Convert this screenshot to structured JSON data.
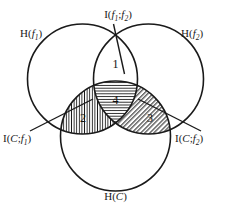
{
  "figure": {
    "background_color": "#ffffff",
    "stroke_color": "#1a1a1a"
  },
  "circles": {
    "left": {
      "label_main": "H",
      "label_open": "(",
      "label_var": "f",
      "label_sub": "1",
      "label_close": ")",
      "label_full": "H(f1)"
    },
    "right": {
      "label_main": "H",
      "label_open": "(",
      "label_var": "f",
      "label_sub": "2",
      "label_close": ")",
      "label_full": "H(f2)"
    },
    "bottom": {
      "label_main": "H",
      "label_open": "(",
      "label_var": "C",
      "label_close": ")",
      "label_full": "H(C)"
    }
  },
  "leader_labels": {
    "top": {
      "label_main": "I",
      "label_open": "(",
      "label_var1": "f",
      "label_sub1": "1",
      "label_sep": ";",
      "label_var2": "f",
      "label_sub2": "2",
      "label_close": ")",
      "label_full": "I(f1;f2)"
    },
    "bottom_left": {
      "label_main": "I",
      "label_open": "(",
      "label_var1": "C",
      "label_sep": ";",
      "label_var2": "f",
      "label_sub2": "1",
      "label_close": ")",
      "label_full": "I(C;f1)"
    },
    "bottom_right": {
      "label_main": "I",
      "label_open": "(",
      "label_var1": "C",
      "label_sep": ";",
      "label_var2": "f",
      "label_sub2": "2",
      "label_close": ")",
      "label_full": "I(C;f2)"
    }
  },
  "regions": [
    {
      "id": "region-1",
      "number": "1",
      "hatch": "none",
      "description": "f1 and f2 overlap excluding C"
    },
    {
      "id": "region-2",
      "number": "2",
      "hatch": "vertical",
      "description": "C and f1 overlap excluding f2"
    },
    {
      "id": "region-3",
      "number": "3",
      "hatch": "diagonal",
      "description": "C and f2 overlap excluding f1"
    },
    {
      "id": "region-4",
      "number": "4",
      "hatch": "horizontal",
      "description": "triple intersection of f1, f2 and C"
    }
  ]
}
